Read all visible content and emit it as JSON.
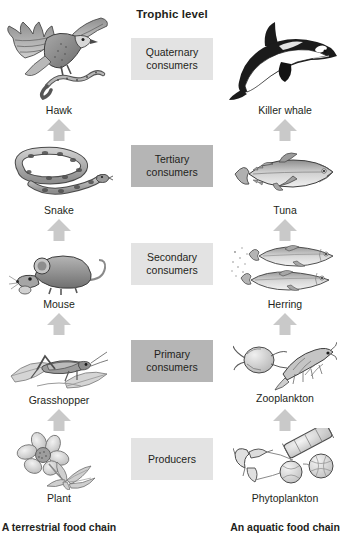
{
  "header": {
    "title": "Trophic level"
  },
  "colors": {
    "box_light": "#e3e3e3",
    "box_dark": "#b5b5b5",
    "text": "#231f20",
    "arrow": "#c9c9c9",
    "background": "#ffffff"
  },
  "levels": [
    {
      "label": "Quaternary consumers",
      "line1": "Quaternary",
      "line2": "consumers",
      "shade": "light"
    },
    {
      "label": "Tertiary consumers",
      "line1": "Tertiary",
      "line2": "consumers",
      "shade": "dark"
    },
    {
      "label": "Secondary consumers",
      "line1": "Secondary",
      "line2": "consumers",
      "shade": "light"
    },
    {
      "label": "Primary consumers",
      "line1": "Primary",
      "line2": "consumers",
      "shade": "dark"
    },
    {
      "label": "Producers",
      "line1": "Producers",
      "line2": "",
      "shade": "light"
    }
  ],
  "terrestrial": {
    "caption": "A terrestrial food chain",
    "organisms": [
      {
        "name": "Hawk",
        "icon": "hawk-illustration"
      },
      {
        "name": "Snake",
        "icon": "snake-illustration"
      },
      {
        "name": "Mouse",
        "icon": "mouse-illustration"
      },
      {
        "name": "Grasshopper",
        "icon": "grasshopper-illustration"
      },
      {
        "name": "Plant",
        "icon": "plant-illustration"
      }
    ]
  },
  "aquatic": {
    "caption": "An aquatic food chain",
    "organisms": [
      {
        "name": "Killer whale",
        "icon": "killer-whale-illustration"
      },
      {
        "name": "Tuna",
        "icon": "tuna-illustration"
      },
      {
        "name": "Herring",
        "icon": "herring-illustration"
      },
      {
        "name": "Zooplankton",
        "icon": "zooplankton-illustration"
      },
      {
        "name": "Phytoplankton",
        "icon": "phytoplankton-illustration"
      }
    ]
  },
  "arrows": {
    "icon": "up-arrow-icon",
    "count_per_chain": 4,
    "direction": "up"
  }
}
